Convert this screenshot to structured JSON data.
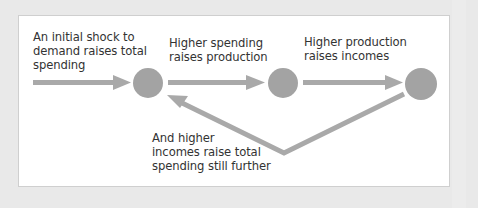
{
  "diagram": {
    "colors": {
      "background": "#e9e9e9",
      "panel": "#ffffff",
      "arrow": "#a9a9a9",
      "node": "#a3a3a3",
      "text": "#333333"
    },
    "nodes": [
      {
        "id": "spending",
        "cx": 148,
        "cy": 83,
        "r": 15
      },
      {
        "id": "production",
        "cx": 283,
        "cy": 83,
        "r": 15
      },
      {
        "id": "incomes",
        "cx": 421,
        "cy": 84,
        "r": 16
      }
    ],
    "labels": {
      "initial_shock": {
        "lines": [
          "An initial shock to",
          "demand raises total",
          "spending"
        ]
      },
      "spending_to_production": {
        "lines": [
          "Higher spending",
          "raises production"
        ]
      },
      "production_to_incomes": {
        "lines": [
          "Higher production",
          "raises incomes"
        ]
      },
      "feedback": {
        "lines": [
          "And higher",
          "incomes raise total",
          "spending still further"
        ]
      }
    },
    "edges": [
      {
        "from": "initial-shock",
        "to": "spending"
      },
      {
        "from": "spending",
        "to": "production"
      },
      {
        "from": "production",
        "to": "incomes"
      },
      {
        "from": "incomes",
        "to": "spending",
        "shape": "v-feedback"
      }
    ]
  }
}
